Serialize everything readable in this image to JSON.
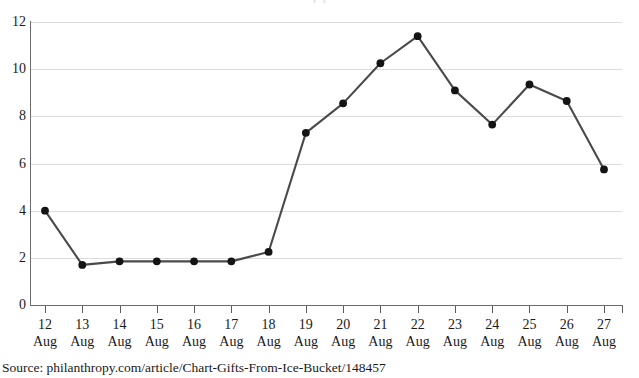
{
  "chart_data": {
    "type": "line",
    "title": "(   )",
    "subtitle": "",
    "xlabel": "",
    "ylabel": "",
    "categories": [
      "12 Aug",
      "13 Aug",
      "14 Aug",
      "15 Aug",
      "16 Aug",
      "17 Aug",
      "18 Aug",
      "19 Aug",
      "20 Aug",
      "21 Aug",
      "22 Aug",
      "23 Aug",
      "24 Aug",
      "25 Aug",
      "26 Aug",
      "27 Aug"
    ],
    "x_tick_days": [
      "12",
      "13",
      "14",
      "15",
      "16",
      "17",
      "18",
      "19",
      "20",
      "21",
      "22",
      "23",
      "24",
      "25",
      "26",
      "27"
    ],
    "x_tick_month": "Aug",
    "values": [
      4.0,
      1.7,
      1.85,
      1.85,
      1.85,
      1.85,
      2.25,
      7.3,
      8.55,
      10.25,
      11.4,
      9.1,
      7.65,
      9.35,
      8.65,
      5.75
    ],
    "ylim": [
      0,
      12
    ],
    "y_ticks": [
      0,
      2,
      4,
      6,
      8,
      10,
      12
    ],
    "y_tick_labels": [
      "0",
      "2",
      "4",
      "6",
      "8",
      "10",
      "12"
    ],
    "grid": true,
    "grid_axis": "y",
    "legend": false,
    "legend_position": "none",
    "markers": true,
    "marker_shape": "circle",
    "series_color": "#4a4a4a",
    "marker_color": "#141414",
    "grid_color": "#dcdcdc",
    "axis_color": "#6b6b6b"
  },
  "source": {
    "text": "Source: philanthropy.com/article/Chart-Gifts-From-Ice-Bucket/148457"
  }
}
